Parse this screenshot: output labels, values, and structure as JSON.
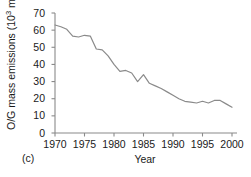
{
  "panel": {
    "label": "(c)"
  },
  "chart_data": {
    "type": "line",
    "title": "",
    "subtitle": "",
    "xlabel": "Year",
    "ylabel": "O/G mass emissions (10",
    "ylabel_sup": "3",
    "ylabel_tail": " mt)",
    "ylabel_full": "O/G mass emissions (10^3 mt)",
    "grid": false,
    "legend": "none",
    "xlim": [
      1969,
      2001
    ],
    "ylim": [
      0,
      72
    ],
    "xticks": [
      1970,
      1975,
      1980,
      1985,
      1990,
      1995,
      2000
    ],
    "xtick_labels": [
      "1970",
      "1975",
      "1980",
      "1985",
      "1990",
      "1995",
      "2000"
    ],
    "yticks": [
      0,
      10,
      20,
      30,
      40,
      50,
      60,
      70
    ],
    "ytick_labels": [
      "0",
      "10",
      "20",
      "30",
      "40",
      "50",
      "60",
      "70"
    ],
    "line_color": "#8a8a8a",
    "axis_color": "#8a8a8a",
    "x": [
      1970,
      1971,
      1972,
      1973,
      1974,
      1975,
      1976,
      1977,
      1978,
      1979,
      1980,
      1981,
      1982,
      1983,
      1984,
      1985,
      1986,
      1987,
      1988,
      1989,
      1990,
      1991,
      1992,
      1993,
      1994,
      1995,
      1996,
      1997,
      1998,
      1999,
      2000
    ],
    "values": [
      63.0,
      62.0,
      60.5,
      56.5,
      56.0,
      57.0,
      56.5,
      49.0,
      48.5,
      45.0,
      40.0,
      36.0,
      36.5,
      35.0,
      30.0,
      34.0,
      29.0,
      27.5,
      26.0,
      24.0,
      22.0,
      20.0,
      18.5,
      18.0,
      17.5,
      18.5,
      17.5,
      19.0,
      19.0,
      17.0,
      15.0
    ],
    "series": [
      {
        "name": "O/G mass emissions",
        "values": [
          63.0,
          62.0,
          60.5,
          56.5,
          56.0,
          57.0,
          56.5,
          49.0,
          48.5,
          45.0,
          40.0,
          36.0,
          36.5,
          35.0,
          30.0,
          34.0,
          29.0,
          27.5,
          26.0,
          24.0,
          22.0,
          20.0,
          18.5,
          18.0,
          17.5,
          18.5,
          17.5,
          19.0,
          19.0,
          17.0,
          15.0
        ]
      }
    ]
  }
}
